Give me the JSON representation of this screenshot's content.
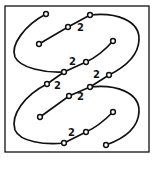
{
  "diagram": {
    "frame": {
      "x": 5,
      "y": 6,
      "width": 144,
      "height": 146,
      "stroke": "#111111"
    },
    "paths": [
      {
        "id": "upper-loop",
        "d": "M46,14 C25,25 10,45 15,57 C20,68 45,73 64,72"
      },
      {
        "id": "upper-inner",
        "d": "M39,44 L68,27 L90,15"
      },
      {
        "id": "upper-right-loop",
        "d": "M90,15 C115,12 140,20 139,40 C138,60 115,72 109,75"
      },
      {
        "id": "upper-diag",
        "d": "M113,41 C105,50 95,58 86,62 L64,72 L47,84"
      },
      {
        "id": "mid-inner",
        "d": "M40,117 L69,96 L90,87"
      },
      {
        "id": "mid-diag",
        "d": "M109,75 L90,87"
      },
      {
        "id": "lower-loop",
        "d": "M47,84 C25,95 10,115 15,130 C20,142 45,145 64,143"
      },
      {
        "id": "lower-right-loop",
        "d": "M90,87 C115,84 140,92 139,112 C138,130 120,140 106,145"
      },
      {
        "id": "lower-diag",
        "d": "M113,112 C105,120 95,128 86,132 L64,143"
      }
    ],
    "nodes": [
      {
        "x": 46,
        "y": 14
      },
      {
        "x": 90,
        "y": 15
      },
      {
        "x": 68,
        "y": 27
      },
      {
        "x": 39,
        "y": 44
      },
      {
        "x": 113,
        "y": 41,
        "filled": true
      },
      {
        "x": 86,
        "y": 62
      },
      {
        "x": 64,
        "y": 72
      },
      {
        "x": 47,
        "y": 84
      },
      {
        "x": 109,
        "y": 75
      },
      {
        "x": 90,
        "y": 87
      },
      {
        "x": 69,
        "y": 96
      },
      {
        "x": 40,
        "y": 117
      },
      {
        "x": 113,
        "y": 112
      },
      {
        "x": 86,
        "y": 132
      },
      {
        "x": 64,
        "y": 143
      },
      {
        "x": 106,
        "y": 145
      }
    ],
    "labels": [
      {
        "text": "2",
        "x": 77,
        "y": 31
      },
      {
        "text": "2",
        "x": 69,
        "y": 65
      },
      {
        "text": "2",
        "x": 54,
        "y": 89
      },
      {
        "text": "2",
        "x": 93,
        "y": 78
      },
      {
        "text": "2",
        "x": 77,
        "y": 100
      },
      {
        "text": "2",
        "x": 68,
        "y": 136
      }
    ]
  }
}
